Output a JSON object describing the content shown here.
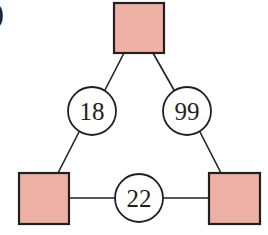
{
  "label": {
    "text": ")"
  },
  "colors": {
    "square_fill": "#eeb0a4",
    "stroke": "#231f20",
    "circle_fill": "#ffffff"
  },
  "squares": [
    {
      "id": "top",
      "x": 114,
      "y": 3,
      "w": 50,
      "h": 50
    },
    {
      "id": "bottom-left",
      "x": 19,
      "y": 173,
      "w": 50,
      "h": 51
    },
    {
      "id": "bottom-right",
      "x": 209,
      "y": 173,
      "w": 51,
      "h": 51
    }
  ],
  "circles": [
    {
      "id": "left-edge",
      "value": "18",
      "cx": 92,
      "cy": 111,
      "r": 24
    },
    {
      "id": "right-edge",
      "value": "99",
      "cx": 187,
      "cy": 111,
      "r": 24
    },
    {
      "id": "bottom-edge",
      "value": "22",
      "cx": 139,
      "cy": 198,
      "r": 24
    }
  ],
  "edges": [
    {
      "from": "top",
      "to": "bottom-left",
      "via": "18"
    },
    {
      "from": "top",
      "to": "bottom-right",
      "via": "99"
    },
    {
      "from": "bottom-left",
      "to": "bottom-right",
      "via": "22"
    }
  ]
}
